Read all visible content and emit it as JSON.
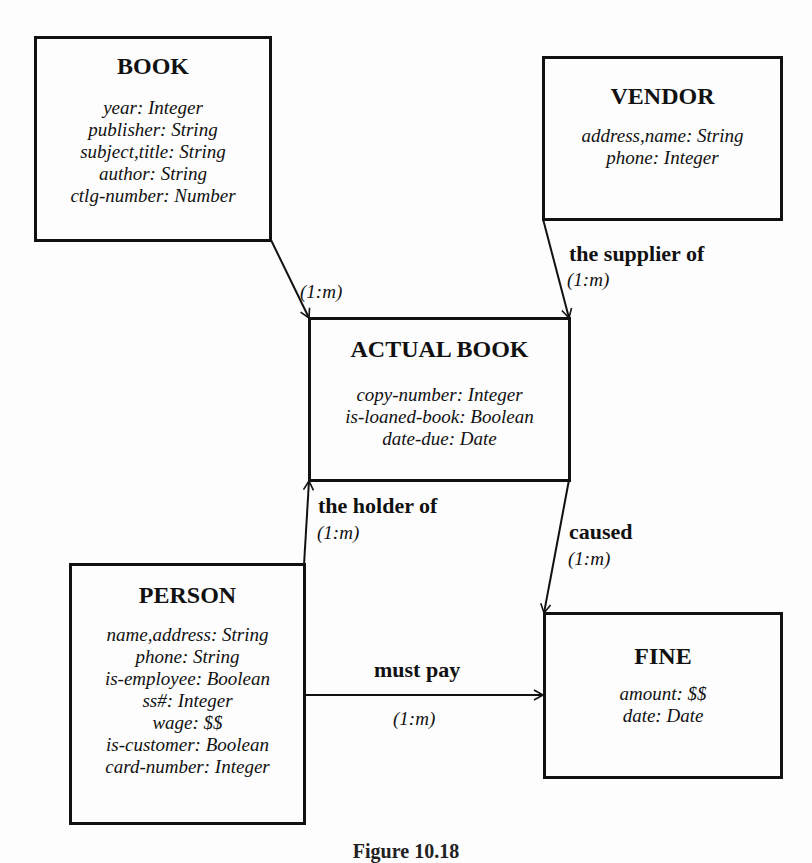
{
  "entities": {
    "book": {
      "title": "BOOK",
      "attributes": [
        "year: Integer",
        "publisher: String",
        "subject,title: String",
        "author: String",
        "ctlg-number: Number"
      ]
    },
    "vendor": {
      "title": "VENDOR",
      "attributes": [
        "address,name: String",
        "phone: Integer"
      ]
    },
    "actual_book": {
      "title": "ACTUAL BOOK",
      "attributes": [
        "copy-number: Integer",
        "is-loaned-book: Boolean",
        "date-due: Date"
      ]
    },
    "person": {
      "title": "PERSON",
      "attributes": [
        "name,address: String",
        "phone: String",
        "is-employee: Boolean",
        "ss#: Integer",
        "wage: $$",
        "is-customer: Boolean",
        "card-number: Integer"
      ]
    },
    "fine": {
      "title": "FINE",
      "attributes": [
        "amount: $$",
        "date: Date"
      ]
    }
  },
  "relationships": {
    "book_actual": {
      "from": "BOOK",
      "to": "ACTUAL BOOK",
      "label": "",
      "cardinality": "(1:m)"
    },
    "vendor_actual": {
      "from": "VENDOR",
      "to": "ACTUAL BOOK",
      "label": "the supplier of",
      "cardinality": "(1:m)"
    },
    "person_actual": {
      "from": "PERSON",
      "to": "ACTUAL BOOK",
      "label": "the holder of",
      "cardinality": "(1:m)"
    },
    "actual_fine": {
      "from": "ACTUAL BOOK",
      "to": "FINE",
      "label": "caused",
      "cardinality": "(1:m)"
    },
    "person_fine": {
      "from": "PERSON",
      "to": "FINE",
      "label": "must pay",
      "cardinality": "(1:m)"
    }
  },
  "caption": "Figure 10.18"
}
